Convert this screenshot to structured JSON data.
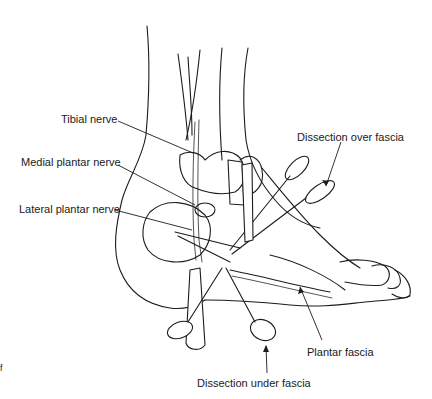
{
  "figure": {
    "labels": [
      {
        "id": "tibial-nerve",
        "text": "Tibial nerve"
      },
      {
        "id": "medial-plantar-nerve",
        "text": "Medial plantar nerve"
      },
      {
        "id": "lateral-plantar-nerve",
        "text": "Lateral plantar nerve"
      },
      {
        "id": "dissection-over-fascia",
        "text": "Dissection over fascia"
      },
      {
        "id": "plantar-fascia",
        "text": "Plantar fascia"
      },
      {
        "id": "dissection-under-fascia",
        "text": "Dissection under fascia"
      }
    ],
    "stray_mark": "f",
    "colors": {
      "background": "#ffffff",
      "ink": "#1c1c1c"
    }
  }
}
